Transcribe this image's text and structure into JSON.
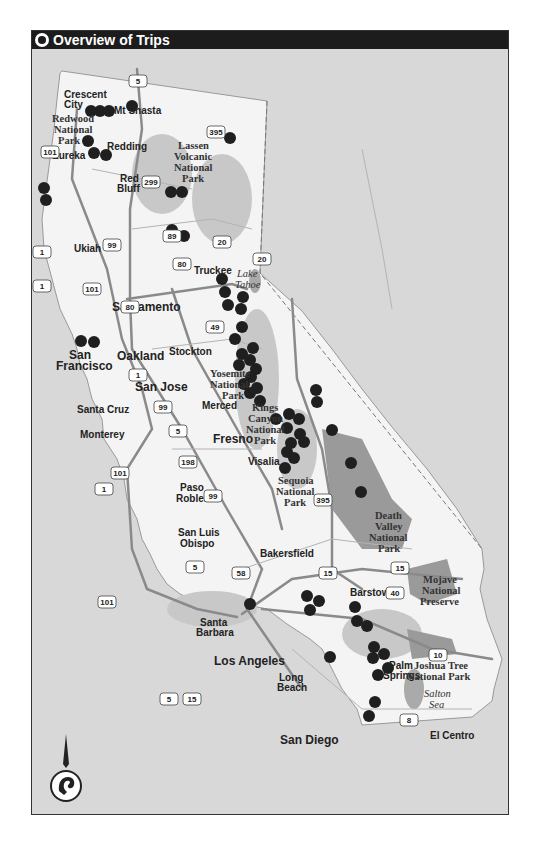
{
  "header": {
    "title": "Overview of Trips",
    "icon": "ram-logo-icon"
  },
  "colors": {
    "background": "#d8d8d8",
    "land": "#f4f4f4",
    "park": "#9a9a9a",
    "mountain": "#c4c4c4",
    "road": "#8a8a8a",
    "marker": "#1f1f1f",
    "title_bar": "#1c1c1c"
  },
  "cities": [
    {
      "name": "Crescent City",
      "lines": [
        "Crescent",
        "City"
      ]
    },
    {
      "name": "Eureka",
      "lines": [
        "Eureka"
      ]
    },
    {
      "name": "Mt Shasta",
      "lines": [
        "Mt Shasta"
      ]
    },
    {
      "name": "Redding",
      "lines": [
        "Redding"
      ]
    },
    {
      "name": "Red Bluff",
      "lines": [
        "Red",
        "Bluff"
      ]
    },
    {
      "name": "Ukiah",
      "lines": [
        "Ukiah"
      ]
    },
    {
      "name": "Truckee",
      "lines": [
        "Truckee"
      ]
    },
    {
      "name": "Sacramento",
      "lines": [
        "Sacramento"
      ]
    },
    {
      "name": "San Francisco",
      "lines": [
        "San",
        "Francisco"
      ]
    },
    {
      "name": "Oakland",
      "lines": [
        "Oakland"
      ]
    },
    {
      "name": "Stockton",
      "lines": [
        "Stockton"
      ]
    },
    {
      "name": "San Jose",
      "lines": [
        "San Jose"
      ]
    },
    {
      "name": "Santa Cruz",
      "lines": [
        "Santa Cruz"
      ]
    },
    {
      "name": "Merced",
      "lines": [
        "Merced"
      ]
    },
    {
      "name": "Monterey",
      "lines": [
        "Monterey"
      ]
    },
    {
      "name": "Fresno",
      "lines": [
        "Fresno"
      ]
    },
    {
      "name": "Visalia",
      "lines": [
        "Visalia"
      ]
    },
    {
      "name": "Paso Robles",
      "lines": [
        "Paso",
        "Robles"
      ]
    },
    {
      "name": "San Luis Obispo",
      "lines": [
        "San Luis",
        "Obispo"
      ]
    },
    {
      "name": "Bakersfield",
      "lines": [
        "Bakersfield"
      ]
    },
    {
      "name": "Barstow",
      "lines": [
        "Barstow"
      ]
    },
    {
      "name": "Santa Barbara",
      "lines": [
        "Santa",
        "Barbara"
      ]
    },
    {
      "name": "Los Angeles",
      "lines": [
        "Los Angeles"
      ]
    },
    {
      "name": "Long Beach",
      "lines": [
        "Long",
        "Beach"
      ]
    },
    {
      "name": "Palm Springs",
      "lines": [
        "Palm",
        "Springs"
      ]
    },
    {
      "name": "San Diego",
      "lines": [
        "San Diego"
      ]
    },
    {
      "name": "El Centro",
      "lines": [
        "El Centro"
      ]
    }
  ],
  "parks": [
    {
      "name": "Redwood National Park",
      "lines": [
        "Redwood",
        "National",
        "Park"
      ]
    },
    {
      "name": "Lassen Volcanic National Park",
      "lines": [
        "Lassen",
        "Volcanic",
        "National",
        "Park"
      ]
    },
    {
      "name": "Yosemite National Park",
      "lines": [
        "Yosemite",
        "National",
        "Park"
      ]
    },
    {
      "name": "Kings Canyon National Park",
      "lines": [
        "Kings",
        "Canyon",
        "National",
        "Park"
      ]
    },
    {
      "name": "Sequoia National Park",
      "lines": [
        "Sequoia",
        "National",
        "Park"
      ]
    },
    {
      "name": "Death Valley National Park",
      "lines": [
        "Death",
        "Valley",
        "National",
        "Park"
      ]
    },
    {
      "name": "Mojave National Preserve",
      "lines": [
        "Mojave",
        "National",
        "Preserve"
      ]
    },
    {
      "name": "Joshua Tree National Park",
      "lines": [
        "Joshua Tree",
        "National Park"
      ]
    }
  ],
  "water": [
    {
      "name": "Lake Tahoe",
      "lines": [
        "Lake",
        "Tahoe"
      ]
    },
    {
      "name": "Salton Sea",
      "lines": [
        "Salton",
        "Sea"
      ]
    }
  ],
  "highways": [
    "5",
    "101",
    "299",
    "395",
    "1",
    "99",
    "89",
    "20",
    "80",
    "49",
    "198",
    "58",
    "15",
    "40",
    "10",
    "8"
  ],
  "trip_markers_count": 62,
  "compass": {
    "icon": "north-arrow-icon",
    "logo": "ram-head-icon"
  }
}
